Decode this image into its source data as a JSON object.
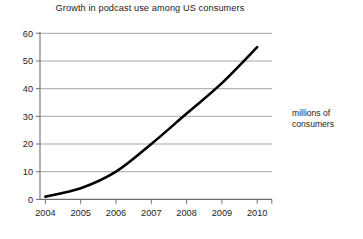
{
  "chart_data": {
    "type": "line",
    "title": "Growth in podcast use among US consumers",
    "xlabel": "",
    "ylabel": "",
    "annotation": "millions of consumers",
    "annotation_lines": [
      "millions of",
      "consumers"
    ],
    "x": [
      "2004",
      "2005",
      "2006",
      "2007",
      "2008",
      "2009",
      "2010"
    ],
    "categories": [
      "2004",
      "2005",
      "2006",
      "2007",
      "2008",
      "2009",
      "2010"
    ],
    "values": [
      1,
      4,
      10,
      20,
      31,
      42,
      55
    ],
    "series": [
      {
        "name": "millions of consumers",
        "values": [
          1,
          4,
          10,
          20,
          31,
          42,
          55
        ],
        "color": "#000000",
        "line_width": 2.6,
        "smooth": true,
        "markers": false
      }
    ],
    "ylim": [
      0,
      60
    ],
    "yticks": [
      0,
      10,
      20,
      30,
      40,
      50,
      60
    ],
    "ytick_labels": [
      "0",
      "10",
      "20",
      "30",
      "40",
      "50",
      "60"
    ],
    "xtick_labels": [
      "2004",
      "2005",
      "2006",
      "2007",
      "2008",
      "2009",
      "2010"
    ],
    "grid": true,
    "grid_axis": "y",
    "grid_color": "#9a9a9a",
    "axis_color": "#6e6e6e",
    "legend": false,
    "legend_position": "none",
    "background": "#ffffff"
  }
}
